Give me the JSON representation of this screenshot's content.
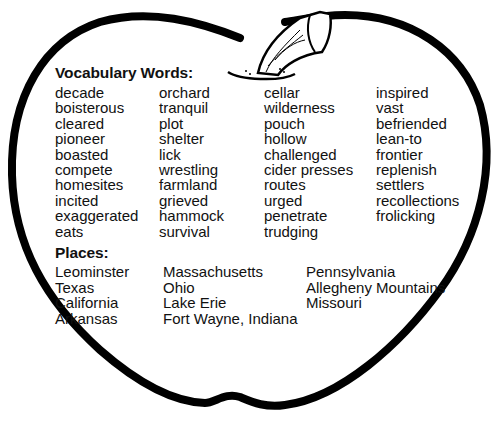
{
  "vocabulary": {
    "heading": "Vocabulary Words:",
    "columns": [
      [
        "decade",
        "boisterous",
        "cleared",
        "pioneer",
        "boasted",
        "compete",
        "homesites",
        "incited",
        "exaggerated",
        "eats"
      ],
      [
        "orchard",
        "tranquil",
        "plot",
        "shelter",
        "lick",
        "wrestling",
        "farmland",
        "grieved",
        "hammock",
        "survival"
      ],
      [
        "cellar",
        "wilderness",
        "pouch",
        "hollow",
        "challenged",
        "cider presses",
        "routes",
        "urged",
        "penetrate",
        "trudging"
      ],
      [
        "inspired",
        "vast",
        "befriended",
        "lean-to",
        "frontier",
        "replenish",
        "settlers",
        "recollections",
        "frolicking"
      ]
    ]
  },
  "places": {
    "heading": "Places:",
    "columns": [
      [
        "Leominster",
        "Texas",
        "California",
        "Arkansas"
      ],
      [
        "Massachusetts",
        "Ohio",
        "Lake Erie",
        "Fort Wayne, Indiana"
      ],
      [
        "Pennsylvania",
        "Allegheny Mountains",
        "Missouri"
      ]
    ]
  },
  "graphic": {
    "shape": "apple-outline",
    "stroke_color": "#000000"
  }
}
